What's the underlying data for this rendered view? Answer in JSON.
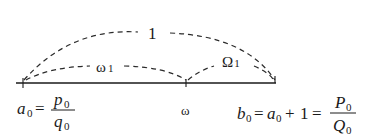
{
  "diagram": {
    "type": "number-line-arcs",
    "baseline": {
      "x1": 16,
      "x2": 276,
      "y": 83
    },
    "points": [
      {
        "id": "a0",
        "x": 23
      },
      {
        "id": "omega",
        "x": 186
      },
      {
        "id": "b0",
        "x": 275
      }
    ],
    "arcs": [
      {
        "id": "arc-one",
        "from": "a0",
        "to": "b0",
        "label": "1"
      },
      {
        "id": "arc-omega1",
        "from": "a0",
        "to": "omega",
        "label": "ω",
        "label_sub": "1"
      },
      {
        "id": "arc-Omega1",
        "from": "omega",
        "to": "b0",
        "label": "Ω",
        "label_sub": "1"
      }
    ],
    "labels": {
      "left": {
        "var": "a",
        "sub": "0",
        "eq": "=",
        "num": "p",
        "num_sub": "0",
        "den": "q",
        "den_sub": "0"
      },
      "middle": {
        "text": "ω"
      },
      "right": {
        "var": "b",
        "sub": "0",
        "eq1": "=",
        "var2": "a",
        "sub2": "0",
        "plus": "+",
        "one": "1",
        "eq2": "=",
        "num": "P",
        "num_sub": "0",
        "den": "Q",
        "den_sub": "0"
      }
    },
    "colors": {
      "line": "#1a1a1a",
      "dash": "#2a2a2a",
      "text": "#1a1a1a"
    }
  }
}
